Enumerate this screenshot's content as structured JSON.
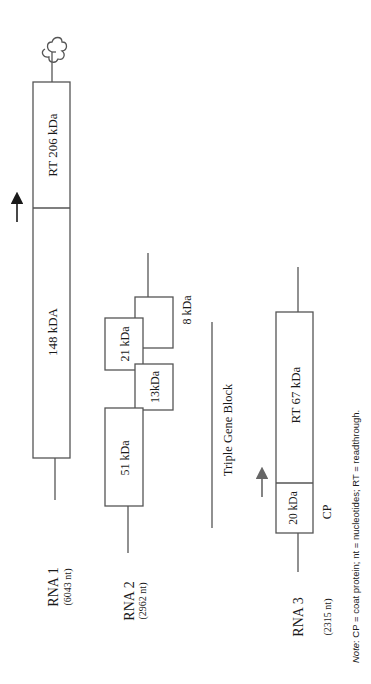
{
  "diagram": {
    "orientation": "rotated 90° counter-clockwise",
    "rna1": {
      "label": "RNA 1",
      "length": "(6043 nt)",
      "orfs": [
        {
          "id": "p148",
          "label": "148 kDA"
        },
        {
          "id": "rt206",
          "label": "RT  206 kDa"
        }
      ],
      "features": [
        "readthrough-arrow",
        "tRNA-like-cloverleaf"
      ]
    },
    "rna2": {
      "label": "RNA 2",
      "length": "(2962 nt)",
      "orfs": [
        {
          "id": "p51",
          "label": "51 kDa"
        },
        {
          "id": "p21",
          "label": "21 kDa"
        },
        {
          "id": "p13",
          "label": "13kDa"
        },
        {
          "id": "p8",
          "label": "8 kDa"
        }
      ],
      "group_label": "Triple Gene Block"
    },
    "rna3": {
      "label": "RNA 3",
      "length": "(2315 nt)",
      "orfs": [
        {
          "id": "p20",
          "label": "20 kDa"
        },
        {
          "id": "rt67",
          "label": "RT 67 kDa"
        }
      ],
      "cp_label": "CP",
      "features": [
        "readthrough-arrow"
      ]
    },
    "note": {
      "prefix": "Note",
      "text": ": CP = coat protein; nt = nucleotides; RT = readthrough."
    }
  },
  "colors": {
    "line": "#555555",
    "text": "#1a1a1a",
    "background": "#ffffff"
  }
}
